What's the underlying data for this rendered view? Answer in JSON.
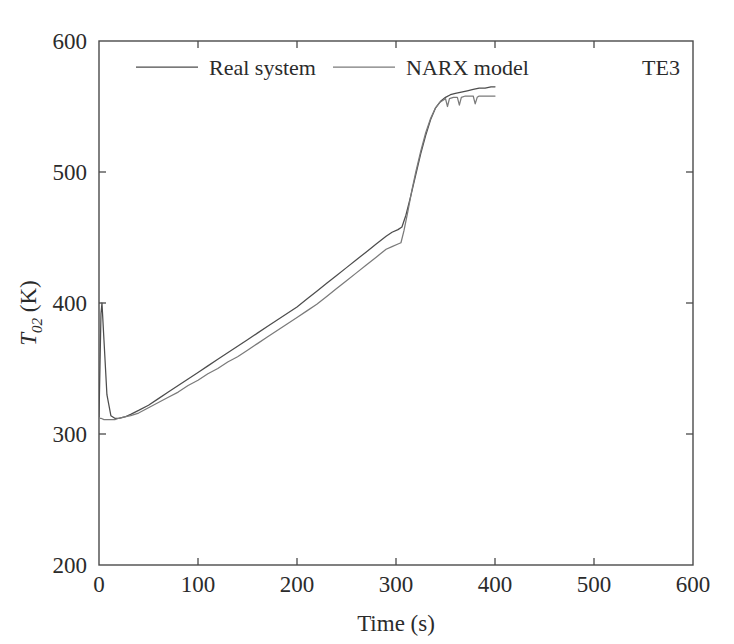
{
  "chart_data": {
    "type": "line",
    "title": "",
    "subtitle": "",
    "annotation": "TE3",
    "xlabel": "Time (s)",
    "ylabel": "T02 (K)",
    "ylabel_parts": {
      "symbol": "T",
      "subscript": "02",
      "units": "(K)"
    },
    "xlim": [
      0,
      600
    ],
    "ylim": [
      200,
      600
    ],
    "xticks": [
      0,
      100,
      200,
      300,
      400,
      500,
      600
    ],
    "yticks": [
      200,
      300,
      400,
      500,
      600
    ],
    "xtick_labels": [
      "0",
      "100",
      "200",
      "300",
      "400",
      "500",
      "600"
    ],
    "ytick_labels": [
      "200",
      "300",
      "400",
      "500",
      "600"
    ],
    "grid": false,
    "legend_position": "top-center-inside",
    "line_color": "#555555",
    "frame_color": "#4a4a4a",
    "series": [
      {
        "name": "Real system",
        "color": "#4d4d4d",
        "x": [
          0,
          1,
          2,
          3,
          5,
          8,
          12,
          16,
          20,
          26,
          32,
          40,
          50,
          60,
          70,
          80,
          90,
          100,
          110,
          120,
          130,
          140,
          150,
          160,
          170,
          180,
          190,
          200,
          210,
          220,
          230,
          240,
          250,
          260,
          270,
          280,
          290,
          296,
          302,
          306,
          310,
          315,
          320,
          325,
          330,
          335,
          340,
          345,
          350,
          355,
          360,
          366,
          372,
          378,
          384,
          390,
          396,
          400
        ],
        "y": [
          313,
          352,
          392,
          400,
          372,
          330,
          314,
          312,
          312,
          313,
          315,
          318,
          322,
          327,
          332,
          337,
          342,
          347,
          352,
          357,
          362,
          367,
          372,
          377,
          382,
          387,
          392,
          397,
          403,
          409,
          415,
          421,
          427,
          433,
          439,
          445,
          451,
          454,
          456,
          458,
          467,
          482,
          498,
          514,
          528,
          540,
          549,
          554,
          557,
          559,
          560,
          561,
          562,
          563,
          564,
          564,
          565,
          565
        ]
      },
      {
        "name": "NARX model",
        "color": "#7a7a7a",
        "x": [
          0,
          2,
          5,
          8,
          12,
          16,
          20,
          26,
          32,
          40,
          50,
          60,
          70,
          80,
          90,
          100,
          110,
          120,
          130,
          140,
          150,
          160,
          170,
          180,
          190,
          200,
          210,
          220,
          230,
          240,
          250,
          260,
          270,
          280,
          290,
          296,
          302,
          305,
          308,
          312,
          316,
          320,
          325,
          330,
          335,
          340,
          344,
          348,
          350,
          352,
          354,
          358,
          362,
          364,
          366,
          370,
          374,
          378,
          380,
          382,
          384,
          388,
          392,
          396,
          400
        ],
        "y": [
          312,
          312,
          311,
          311,
          311,
          311,
          312,
          313,
          314,
          316,
          320,
          324,
          328,
          332,
          337,
          341,
          346,
          350,
          355,
          359,
          364,
          369,
          374,
          379,
          384,
          389,
          394,
          399,
          405,
          411,
          417,
          423,
          429,
          435,
          441,
          443,
          445,
          446,
          455,
          470,
          486,
          500,
          516,
          530,
          541,
          549,
          553,
          555,
          556,
          550,
          556,
          557,
          557,
          551,
          557,
          558,
          558,
          558,
          552,
          557,
          558,
          558,
          558,
          558,
          558
        ]
      }
    ],
    "legend": [
      {
        "label": "Real system",
        "color": "#4d4d4d"
      },
      {
        "label": "NARX model",
        "color": "#7a7a7a"
      }
    ]
  }
}
